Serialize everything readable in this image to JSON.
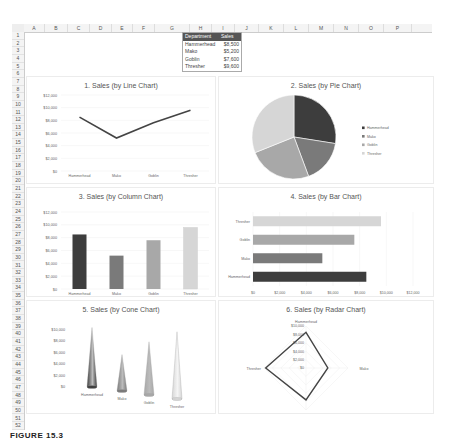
{
  "spreadsheet": {
    "columns": [
      "A",
      "B",
      "C",
      "D",
      "E",
      "F",
      "G",
      "H",
      "I",
      "J",
      "K",
      "L",
      "M",
      "N",
      "O",
      "P"
    ],
    "rows": [
      "1",
      "2",
      "3",
      "4",
      "5",
      "6",
      "7",
      "8",
      "9",
      "10",
      "11",
      "12",
      "13",
      "14",
      "15",
      "16",
      "17",
      "18",
      "19",
      "20",
      "21",
      "22",
      "23",
      "24",
      "25",
      "26",
      "27",
      "28",
      "29",
      "30",
      "31",
      "32",
      "33",
      "34",
      "35",
      "36",
      "37",
      "38",
      "39",
      "40",
      "41",
      "42",
      "43",
      "44",
      "45",
      "46",
      "47",
      "48",
      "49",
      "50",
      "51",
      "52"
    ],
    "table": {
      "headers": [
        "Department",
        "Sales"
      ],
      "rows": [
        {
          "department": "Hammerhead",
          "sales": "$8,500"
        },
        {
          "department": "Mako",
          "sales": "$5,200"
        },
        {
          "department": "Goblin",
          "sales": "$7,600"
        },
        {
          "department": "Thresher",
          "sales": "$9,600"
        }
      ]
    }
  },
  "colors": {
    "hammerhead": "#3d3d3d",
    "mako": "#7a7a7a",
    "goblin": "#a8a8a8",
    "thresher": "#d6d6d6",
    "line": "#444444",
    "header_bg": "#555555"
  },
  "charts": {
    "c1": {
      "title": "1. Sales (by Line Chart)"
    },
    "c2": {
      "title": "2. Sales (by Pie Chart)"
    },
    "c3": {
      "title": "3. Sales (by Column Chart)"
    },
    "c4": {
      "title": "4. Sales (by Bar Chart)"
    },
    "c5": {
      "title": "5. Sales (by Cone Chart)"
    },
    "c6": {
      "title": "6. Sales (by Radar Chart)"
    }
  },
  "caption": "FIGURE 15.3",
  "chart_data": [
    {
      "type": "line",
      "title": "1. Sales (by Line Chart)",
      "categories": [
        "Hammerhead",
        "Mako",
        "Goblin",
        "Thresher"
      ],
      "values": [
        8500,
        5200,
        7600,
        9600
      ],
      "ylim": [
        0,
        12000
      ],
      "yticks": [
        "$0",
        "$2,000",
        "$4,000",
        "$6,000",
        "$8,000",
        "$10,000",
        "$12,000"
      ],
      "grid": true
    },
    {
      "type": "pie",
      "title": "2. Sales (by Pie Chart)",
      "categories": [
        "Hammerhead",
        "Mako",
        "Goblin",
        "Thresher"
      ],
      "values": [
        8500,
        5200,
        7600,
        9600
      ],
      "legend": [
        "Hammerhead",
        "Mako",
        "Goblin",
        "Thresher"
      ],
      "legend_position": "right"
    },
    {
      "type": "bar",
      "title": "3. Sales (by Column Chart)",
      "categories": [
        "Hammerhead",
        "Mako",
        "Goblin",
        "Thresher"
      ],
      "values": [
        8500,
        5200,
        7600,
        9600
      ],
      "ylim": [
        0,
        12000
      ],
      "yticks": [
        "$0",
        "$2,000",
        "$4,000",
        "$6,000",
        "$8,000",
        "$10,000",
        "$12,000"
      ],
      "grid": true
    },
    {
      "type": "bar",
      "orientation": "horizontal",
      "title": "4. Sales (by Bar Chart)",
      "categories": [
        "Hammerhead",
        "Mako",
        "Goblin",
        "Thresher"
      ],
      "values": [
        8500,
        5200,
        7600,
        9600
      ],
      "xlim": [
        0,
        12000
      ],
      "xticks": [
        "$0",
        "$2,000",
        "$4,000",
        "$6,000",
        "$8,000",
        "$10,000",
        "$12,000"
      ],
      "grid": true
    },
    {
      "type": "bar",
      "style": "3d-cone",
      "title": "5. Sales (by Cone Chart)",
      "categories": [
        "Hammerhead",
        "Mako",
        "Goblin",
        "Thresher"
      ],
      "values": [
        8500,
        5200,
        7600,
        9600
      ],
      "ylim": [
        0,
        10000
      ],
      "yticks": [
        "$0",
        "$2,000",
        "$4,000",
        "$6,000",
        "$8,000",
        "$10,000"
      ]
    },
    {
      "type": "radar",
      "title": "6. Sales (by Radar Chart)",
      "categories": [
        "Hammerhead",
        "Mako",
        "Goblin",
        "Thresher"
      ],
      "values": [
        8500,
        5200,
        7600,
        9600
      ],
      "rlim": [
        0,
        10000
      ],
      "rticks": [
        "$0",
        "$2,000",
        "$4,000",
        "$6,000",
        "$8,000",
        "$10,000"
      ]
    }
  ]
}
